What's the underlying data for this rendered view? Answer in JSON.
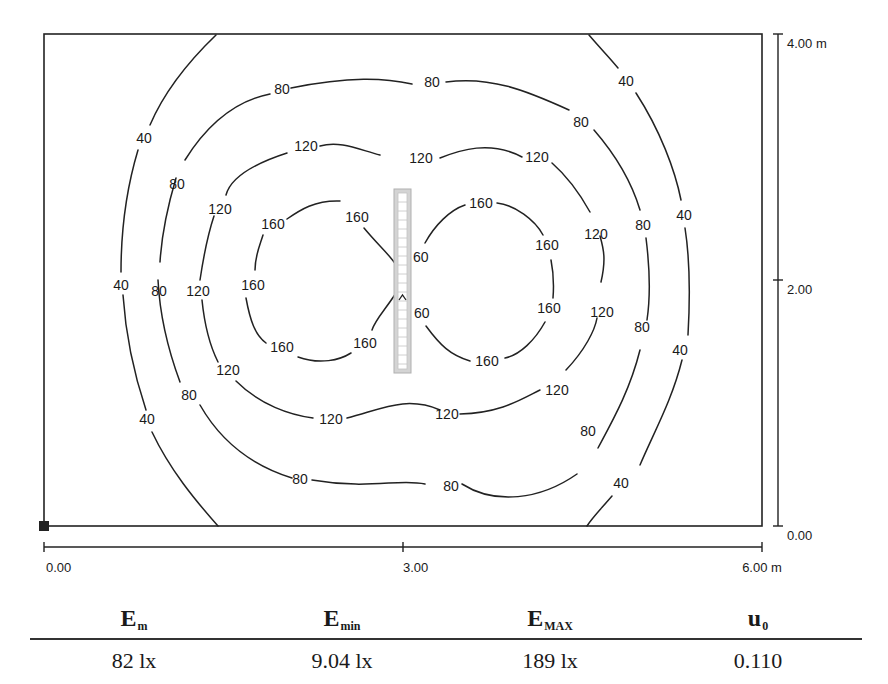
{
  "plot": {
    "x_axis": {
      "ticks": [
        "0.00",
        "3.00",
        "6.00 m"
      ],
      "range_m": [
        0,
        6
      ]
    },
    "y_axis": {
      "ticks": [
        "0.00",
        "2.00",
        "4.00 m"
      ],
      "range_m": [
        0,
        4
      ]
    },
    "isolines": {
      "levels_lx": [
        40,
        80,
        120,
        160
      ],
      "labels": {
        "l40": "40",
        "l80": "80",
        "l120": "120",
        "l160": "160",
        "l60_partial": "60"
      }
    },
    "luminaire": {
      "description": "linear luminaire at center",
      "marker": "^"
    },
    "origin_marker": "origin-square"
  },
  "stats": {
    "headers": [
      {
        "main": "E",
        "sub": "m"
      },
      {
        "main": "E",
        "sub": "min"
      },
      {
        "main": "E",
        "sub": "MAX"
      },
      {
        "main": "u",
        "sub": "0"
      }
    ],
    "values": [
      "82 lx",
      "9.04 lx",
      "189 lx",
      "0.110"
    ]
  }
}
